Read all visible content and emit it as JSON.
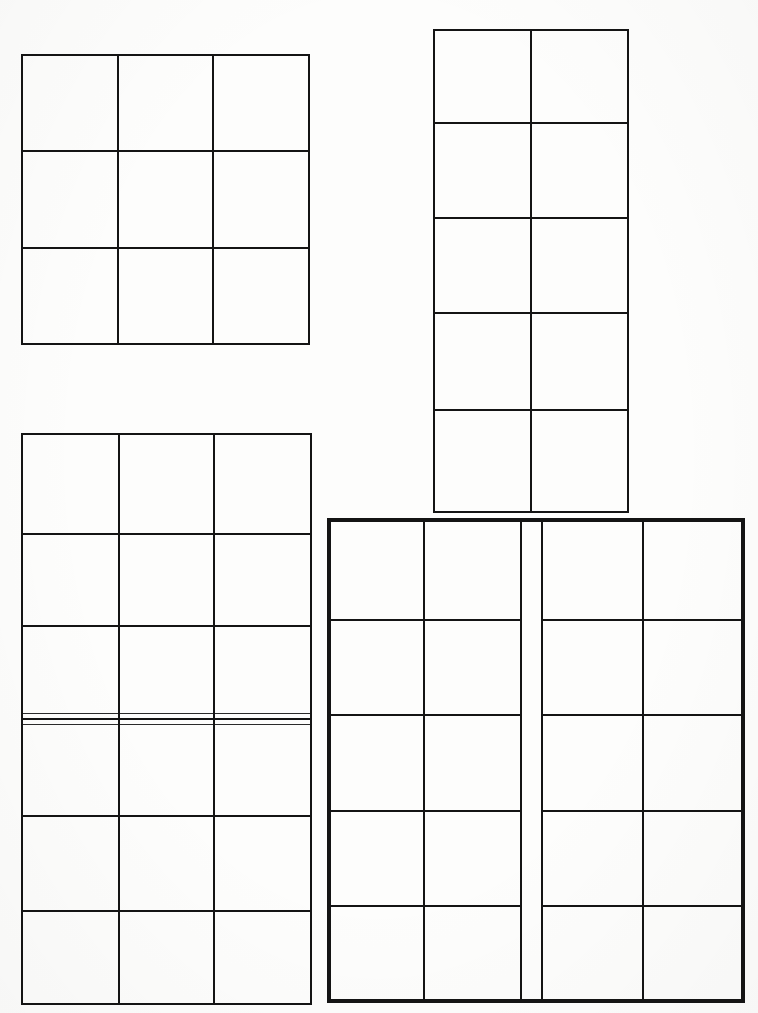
{
  "page": {
    "width": 758,
    "height": 1013,
    "background_color": "#fdfdfc",
    "ink_color": "#141414"
  },
  "chart_data": {
    "type": "table",
    "grids": [
      {
        "id": "grid-top-left",
        "name": "Top-left 3x3 grid",
        "columns": 3,
        "rows": 3,
        "cell_count": 9,
        "bounds": {
          "x": 21,
          "y": 54,
          "width": 289,
          "height": 290
        },
        "column_edges": [
          21,
          117,
          212,
          310
        ],
        "row_edges": [
          54,
          150,
          247,
          344
        ],
        "border_weight": "medium",
        "cells": [
          [
            "",
            "",
            ""
          ],
          [
            "",
            "",
            ""
          ],
          [
            "",
            "",
            ""
          ]
        ]
      },
      {
        "id": "grid-top-right",
        "name": "Top-right 2x5 grid",
        "columns": 2,
        "rows": 5,
        "cell_count": 10,
        "bounds": {
          "x": 433,
          "y": 29,
          "width": 196,
          "height": 484
        },
        "column_edges": [
          433,
          530,
          629
        ],
        "row_edges": [
          29,
          122,
          217,
          312,
          409,
          513
        ],
        "border_weight": "medium",
        "cells": [
          [
            "",
            ""
          ],
          [
            "",
            ""
          ],
          [
            "",
            ""
          ],
          [
            "",
            ""
          ],
          [
            "",
            ""
          ]
        ]
      },
      {
        "id": "grid-bottom-left",
        "name": "Bottom-left 3x6 grid with triple rule",
        "columns": 3,
        "rows": 6,
        "cell_count": 18,
        "bounds": {
          "x": 21,
          "y": 433,
          "width": 291,
          "height": 572
        },
        "column_edges": [
          21,
          118,
          213,
          312
        ],
        "row_edges": [
          433,
          533,
          625,
          719,
          815,
          910,
          1005
        ],
        "border_weight": "medium",
        "special_rule": {
          "after_row": 3,
          "style": "triple-line",
          "y_positions": [
            713,
            719,
            724
          ],
          "note": "Three closely-spaced parallel horizontal rules instead of one separator"
        },
        "cells": [
          [
            "",
            "",
            ""
          ],
          [
            "",
            "",
            ""
          ],
          [
            "",
            "",
            ""
          ],
          [
            "",
            "",
            ""
          ],
          [
            "",
            "",
            ""
          ],
          [
            "",
            "",
            ""
          ]
        ]
      },
      {
        "id": "grid-bottom-right",
        "name": "Bottom-right 4x5 grid with centre gutter",
        "columns": 4,
        "rows": 5,
        "cell_count": 20,
        "bounds": {
          "x": 327,
          "y": 518,
          "width": 418,
          "height": 485
        },
        "column_edges": [
          327,
          423,
          520,
          543,
          642,
          745
        ],
        "gutter": {
          "x_start": 520,
          "x_end": 543,
          "width": 23
        },
        "row_edges": [
          518,
          619,
          714,
          810,
          905,
          1003
        ],
        "border_weight": "heavy",
        "cells": [
          [
            "",
            "",
            "",
            ""
          ],
          [
            "",
            "",
            "",
            ""
          ],
          [
            "",
            "",
            "",
            ""
          ],
          [
            "",
            "",
            "",
            ""
          ],
          [
            "",
            "",
            "",
            ""
          ]
        ]
      }
    ],
    "totals": {
      "grid_count": 4,
      "total_cells": 57
    }
  }
}
